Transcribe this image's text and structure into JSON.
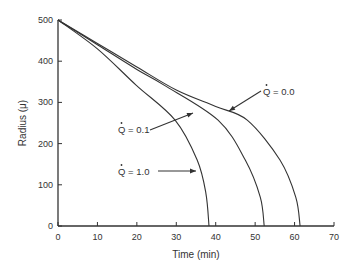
{
  "chart_data": {
    "type": "line",
    "title": "",
    "xlabel": "Time (min)",
    "ylabel": "Radius (μ)",
    "xlim": [
      0,
      70
    ],
    "ylim": [
      0,
      500
    ],
    "xticks": [
      0,
      10,
      20,
      30,
      40,
      50,
      60,
      70
    ],
    "yticks": [
      0,
      100,
      200,
      300,
      400,
      500
    ],
    "grid": false,
    "legend": "none (inline arrow annotations)",
    "series": [
      {
        "name": "Q̇ = 1.0",
        "label_text": "Q = 1.0",
        "x": [
          0,
          10,
          19.8,
          29.7,
          35.3,
          37.5,
          38.3
        ],
        "y": [
          500,
          430,
          342,
          257,
          160,
          80,
          0
        ]
      },
      {
        "name": "Q̇ = 0.1",
        "label_text": "Q = 0.1",
        "x": [
          0,
          10,
          20,
          26.9,
          40.6,
          47.5,
          51.3,
          52.3
        ],
        "y": [
          500,
          440,
          380,
          342,
          257,
          160,
          70,
          0
        ]
      },
      {
        "name": "Q̇ = 0.0",
        "label_text": "Q = 0.0",
        "x": [
          0,
          10,
          20,
          30,
          40,
          48,
          56.3,
          60.3,
          61.4
        ],
        "y": [
          500,
          443,
          386,
          330,
          290,
          257,
          160,
          70,
          0
        ]
      }
    ]
  }
}
